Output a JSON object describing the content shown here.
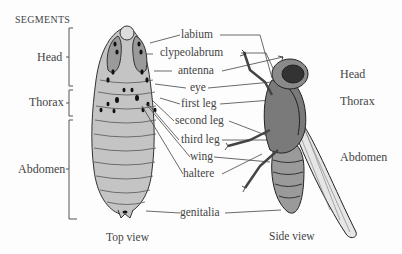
{
  "diagram": {
    "segments_title": "SEGMENTS",
    "segments_left": [
      {
        "label": "Head"
      },
      {
        "label": "Thorax"
      },
      {
        "label": "Abdomen"
      }
    ],
    "segments_right": [
      {
        "label": "Head"
      },
      {
        "label": "Thorax"
      },
      {
        "label": "Abdomen"
      }
    ],
    "parts": [
      {
        "label": "labium"
      },
      {
        "label": "clypeolabrum"
      },
      {
        "label": "antenna"
      },
      {
        "label": "eye"
      },
      {
        "label": "first leg"
      },
      {
        "label": "second leg"
      },
      {
        "label": "third leg"
      },
      {
        "label": "wing"
      },
      {
        "label": "haltere"
      },
      {
        "label": "genitalia"
      }
    ],
    "captions": {
      "top_view": "Top view",
      "side_view": "Side view"
    },
    "colors": {
      "ink": "#3a3a3a",
      "body_fill": "#bdbdbd",
      "light_fill": "#d8d8d8",
      "dark_fill": "#5a5a5a",
      "wing_fill": "#e6e6e6"
    }
  }
}
